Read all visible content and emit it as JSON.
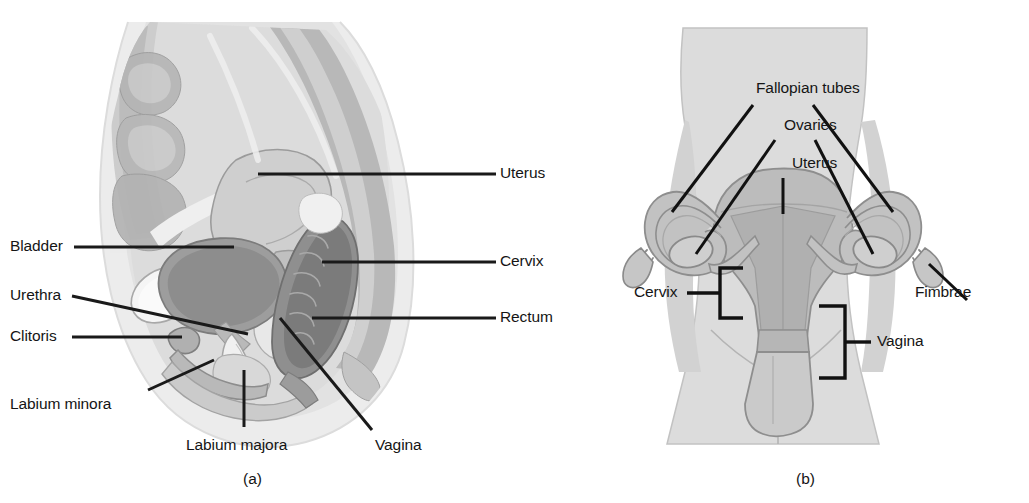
{
  "figure": {
    "panels": [
      {
        "id": "a",
        "caption": "(a)",
        "view": "midsagittal-section",
        "labels": [
          {
            "key": "uterus",
            "text": "Uterus"
          },
          {
            "key": "cervix",
            "text": "Cervix"
          },
          {
            "key": "rectum",
            "text": "Rectum"
          },
          {
            "key": "bladder",
            "text": "Bladder"
          },
          {
            "key": "urethra",
            "text": "Urethra"
          },
          {
            "key": "clitoris",
            "text": "Clitoris"
          },
          {
            "key": "labium_minora",
            "text": "Labium minora"
          },
          {
            "key": "labium_majora",
            "text": "Labium majora"
          },
          {
            "key": "vagina",
            "text": "Vagina"
          }
        ]
      },
      {
        "id": "b",
        "caption": "(b)",
        "view": "anterior-frontal",
        "labels": [
          {
            "key": "fallopian_tubes",
            "text": "Fallopian tubes"
          },
          {
            "key": "ovaries",
            "text": "Ovaries"
          },
          {
            "key": "uterus",
            "text": "Uterus"
          },
          {
            "key": "cervix",
            "text": "Cervix"
          },
          {
            "key": "fimbrae",
            "text": "Fimbrae"
          },
          {
            "key": "vagina",
            "text": "Vagina"
          }
        ]
      }
    ]
  },
  "colors": {
    "background": "#ffffff",
    "leader_line": "#1a1a1a",
    "label_text": "#151515",
    "body_fill": "#d9d9d9",
    "body_outline": "#9a9a9a",
    "tissue_light": "#e4e4e4",
    "tissue_mid": "#c6c6c6",
    "tissue_dark": "#9d9d9d",
    "organ_dark": "#8a8a8a",
    "organ_darker": "#747474",
    "highlight": "#f4f4f4",
    "outline_thin": "#8f8f8f"
  }
}
